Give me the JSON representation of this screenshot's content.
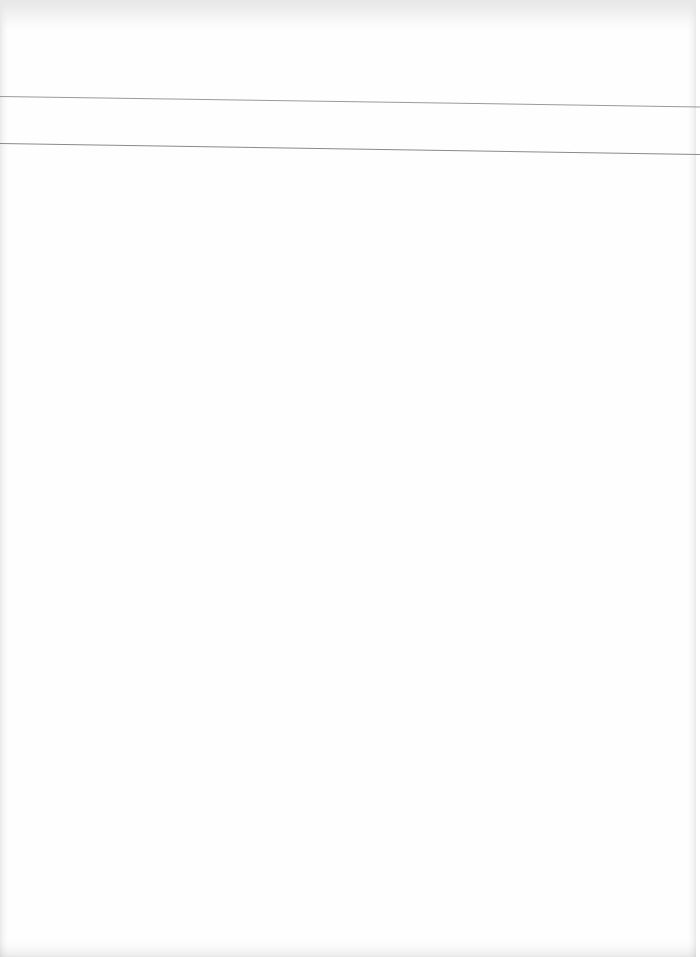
{
  "document": {
    "type": "blank-scanned-page",
    "rules": [
      {
        "y": 96,
        "color": "#9a9a9a"
      },
      {
        "y": 143,
        "color": "#8a8a8a"
      }
    ],
    "background": "#fefefe"
  }
}
